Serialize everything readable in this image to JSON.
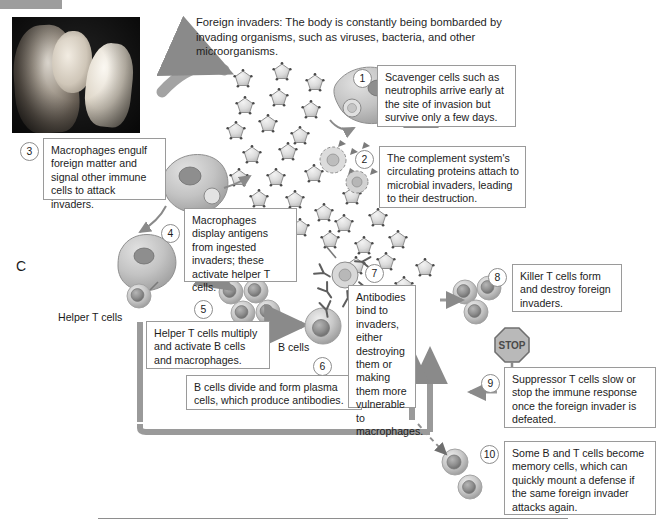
{
  "figure": {
    "panel_letter": "C",
    "intro_text": "Foreign invaders: The body is constantly being bombarded by invading organisms, such as viruses, bacteria, and other microorganisms.",
    "photo_caption": "",
    "accent_color": "#8c8c8c",
    "box_border_color": "#9a9a9a",
    "text_color": "#1c1c1c"
  },
  "labels": {
    "helper_t_cells": "Helper T cells",
    "b_cells": "B cells",
    "stop_sign": "STOP"
  },
  "steps": [
    {
      "number": "1",
      "text": "Scavenger cells such as neutrophils arrive early at the site of invasion but survive only a few days."
    },
    {
      "number": "2",
      "text": "The complement system's circulating proteins attach to microbial invaders, leading to their destruction."
    },
    {
      "number": "3",
      "text": "Macrophages engulf foreign matter and signal other immune cells to attack invaders."
    },
    {
      "number": "4",
      "text": "Macrophages display antigens from ingested invaders; these activate helper T cells."
    },
    {
      "number": "5",
      "text": "Helper T cells multiply and activate B cells and macrophages."
    },
    {
      "number": "6",
      "text": "B cells divide and form plasma cells, which produce antibodies."
    },
    {
      "number": "7",
      "text": "Antibodies bind to invaders, either destroying them or making them more vulnerable to macrophages."
    },
    {
      "number": "8",
      "text": "Killer T cells form and destroy foreign invaders."
    },
    {
      "number": "9",
      "text": "Suppressor T cells slow or stop the immune response once the foreign invader is defeated."
    },
    {
      "number": "10",
      "text": "Some B and T cells become memory cells, which can quickly mount a defense if the same foreign invader attacks again."
    }
  ],
  "icons": {
    "virus_particle": "virus-particle-icon",
    "macrophage": "macrophage-cell-icon",
    "t_cell": "t-cell-icon",
    "b_cell": "b-cell-icon",
    "plasma_cell": "plasma-cell-icon",
    "memory_cell": "memory-cell-icon",
    "killer_t_cell": "killer-t-cell-icon",
    "antibody": "antibody-y-icon",
    "stop_sign": "stop-sign-icon",
    "photo": "mother-and-child-photo"
  }
}
